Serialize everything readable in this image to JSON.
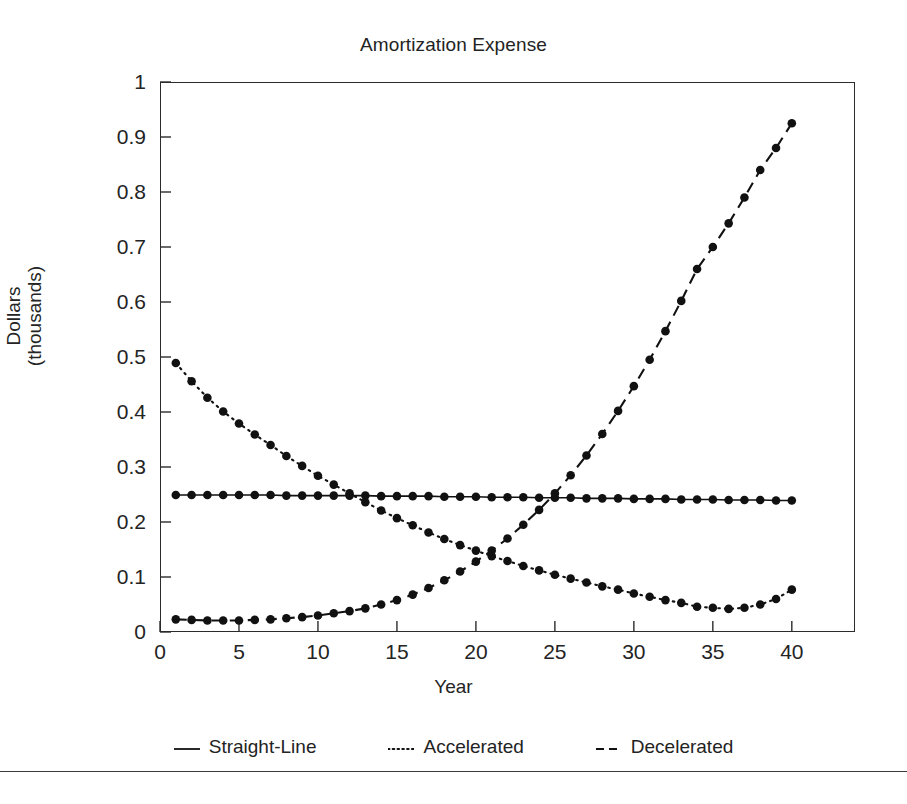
{
  "running_head": "Amortization Methods",
  "chart": {
    "title": "Amortization Expense",
    "xlabel": "Year",
    "ylabel_line1": "Dollars",
    "ylabel_line2": "(thousands)"
  },
  "legend": {
    "items": [
      {
        "key": "solid-line-key",
        "label": "Straight-Line"
      },
      {
        "key": "dotted-line-key",
        "label": "Accelerated"
      },
      {
        "key": "dashed-line-key",
        "label": "Decelerated"
      }
    ]
  },
  "colors": {
    "ink": "#1d1d1d",
    "axis": "#2b2b2b",
    "series": "#111111",
    "background": "#ffffff"
  },
  "chart_data": {
    "type": "line",
    "title": "Amortization Expense",
    "xlabel": "Year",
    "ylabel": "Dollars (thousands)",
    "xlim": [
      0,
      44
    ],
    "ylim": [
      0,
      1
    ],
    "grid": false,
    "legend_position": "below",
    "xticks": [
      0,
      5,
      10,
      15,
      20,
      25,
      30,
      35,
      40
    ],
    "yticks": [
      0,
      0.1,
      0.2,
      0.3,
      0.4,
      0.5,
      0.6,
      0.7,
      0.8,
      0.9,
      1
    ],
    "x": [
      1,
      2,
      3,
      4,
      5,
      6,
      7,
      8,
      9,
      10,
      11,
      12,
      13,
      14,
      15,
      16,
      17,
      18,
      19,
      20,
      21,
      22,
      23,
      24,
      25,
      26,
      27,
      28,
      29,
      30,
      31,
      32,
      33,
      34,
      35,
      36,
      37,
      38,
      39,
      40
    ],
    "series": [
      {
        "name": "Straight-Line",
        "style": "solid",
        "marker": "circle",
        "values": [
          0.249,
          0.249,
          0.249,
          0.249,
          0.249,
          0.249,
          0.249,
          0.248,
          0.248,
          0.248,
          0.248,
          0.248,
          0.248,
          0.247,
          0.247,
          0.247,
          0.247,
          0.246,
          0.246,
          0.246,
          0.245,
          0.245,
          0.245,
          0.244,
          0.244,
          0.244,
          0.243,
          0.243,
          0.243,
          0.242,
          0.242,
          0.242,
          0.241,
          0.241,
          0.241,
          0.24,
          0.24,
          0.24,
          0.239,
          0.239
        ]
      },
      {
        "name": "Accelerated",
        "style": "dotted",
        "marker": "circle",
        "values": [
          0.489,
          0.456,
          0.426,
          0.401,
          0.379,
          0.359,
          0.34,
          0.32,
          0.302,
          0.284,
          0.268,
          0.252,
          0.236,
          0.221,
          0.207,
          0.194,
          0.181,
          0.169,
          0.158,
          0.148,
          0.138,
          0.129,
          0.12,
          0.112,
          0.104,
          0.097,
          0.09,
          0.083,
          0.077,
          0.07,
          0.064,
          0.058,
          0.053,
          0.046,
          0.044,
          0.042,
          0.044,
          0.05,
          0.06,
          0.077
        ]
      },
      {
        "name": "Decelerated",
        "style": "dashed",
        "marker": "circle",
        "values": [
          0.023,
          0.022,
          0.021,
          0.021,
          0.021,
          0.022,
          0.023,
          0.025,
          0.027,
          0.03,
          0.034,
          0.038,
          0.043,
          0.05,
          0.058,
          0.068,
          0.08,
          0.094,
          0.11,
          0.128,
          0.148,
          0.17,
          0.195,
          0.222,
          0.252,
          0.285,
          0.321,
          0.36,
          0.402,
          0.447,
          0.495,
          0.547,
          0.602,
          0.66,
          0.7,
          0.743,
          0.79,
          0.84,
          0.88,
          0.925
        ]
      }
    ]
  }
}
